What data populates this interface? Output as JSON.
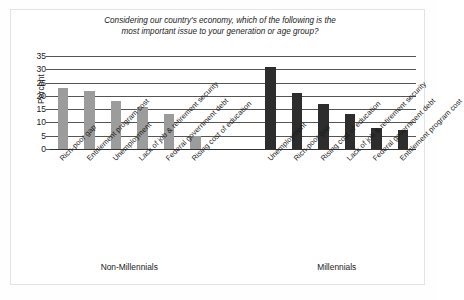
{
  "chart_data": {
    "type": "bar",
    "title": "Considering our country's economy, which of the following is the most important issue to your generation or age group?",
    "title_lines": [
      "Considering our country's economy, which of the following is the",
      "most important issue to your generation or age group?"
    ],
    "xlabel": "",
    "ylabel": "Percent",
    "ylim": [
      0,
      35
    ],
    "yticks": [
      0,
      5,
      10,
      15,
      20,
      25,
      30,
      35
    ],
    "grid": true,
    "legend": "none",
    "groups": [
      {
        "name": "Non-Millennials",
        "color": "#9c9c9c",
        "categories": [
          "Rich-poor gap",
          "Entitlement program cost",
          "Unemployment",
          "Lack of job & retirement security",
          "Federal government debt",
          "Rising cost of education"
        ],
        "values": [
          23,
          22,
          18,
          16,
          13,
          5
        ]
      },
      {
        "name": "Millennials",
        "color": "#2d2d2d",
        "categories": [
          "Unemployment",
          "Rich-poor gap",
          "Rising cost of education",
          "Lack of job & retirement security",
          "Federal government debt",
          "Entitlement program cost"
        ],
        "values": [
          31,
          21,
          17,
          13,
          8,
          7
        ]
      }
    ]
  },
  "colors": {
    "non_millennials_bar": "#9c9c9c",
    "millennials_bar": "#2d2d2d",
    "gridline": "#555555",
    "frame": "#e3e3e3",
    "text": "#1a1a1a"
  }
}
